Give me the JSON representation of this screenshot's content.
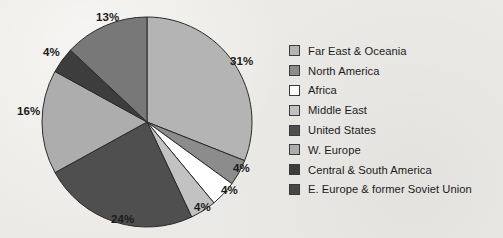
{
  "chart_data": {
    "type": "pie",
    "title": "",
    "legend_position": "right",
    "start_angle_deg": 0,
    "direction": "clockwise",
    "center": {
      "x": 147,
      "y": 122
    },
    "radius": 105,
    "categories": [
      "Far East & Oceania",
      "North America",
      "Africa",
      "Middle East",
      "United States",
      "W. Europe",
      "Central & South America",
      "E. Europe & former Soviet Union"
    ],
    "values": [
      31,
      4,
      4,
      4,
      24,
      16,
      4,
      13
    ],
    "value_labels": [
      "31%",
      "4%",
      "4%",
      "4%",
      "24%",
      "16%",
      "4%",
      "13%"
    ],
    "colors": [
      "#b4b4b4",
      "#8c8c8c",
      "#ffffff",
      "#c2c2c2",
      "#4f4f4f",
      "#adadad",
      "#3d3d3d",
      "#787878"
    ],
    "slice_border_color": "#2b2b2b",
    "units": "percent"
  },
  "labels": {
    "far_east": "31%",
    "north_america": "4%",
    "africa": "4%",
    "middle_east": "4%",
    "united_states": "24%",
    "w_europe": "16%",
    "central_south_america": "4%",
    "e_europe": "13%"
  },
  "legend": {
    "items": [
      {
        "label": "Far East & Oceania",
        "color": "#b4b4b4"
      },
      {
        "label": "North America",
        "color": "#8c8c8c"
      },
      {
        "label": "Africa",
        "color": "#ffffff"
      },
      {
        "label": "Middle East",
        "color": "#c2c2c2"
      },
      {
        "label": "United States",
        "color": "#4f4f4f"
      },
      {
        "label": "W. Europe",
        "color": "#adadad"
      },
      {
        "label": "Central & South America",
        "color": "#3d3d3d"
      },
      {
        "label": "E. Europe & former Soviet Union",
        "color": "#474747"
      }
    ]
  }
}
